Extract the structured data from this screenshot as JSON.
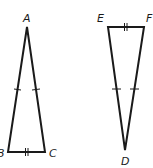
{
  "diagram": {
    "type": "congruent isosceles triangles",
    "triangles": [
      {
        "name": "ABC",
        "vertices": {
          "A": {
            "label": "A",
            "x": 27,
            "y": 27,
            "label_x": 24,
            "label_y": 22
          },
          "B": {
            "label": "B",
            "x": 8,
            "y": 152,
            "label_x": -3,
            "label_y": 157
          },
          "C": {
            "label": "C",
            "x": 45,
            "y": 152,
            "label_x": 49,
            "label_y": 157
          }
        },
        "congruence_marks": {
          "AB": "single tick",
          "AC": "single tick",
          "BC": "double tick"
        }
      },
      {
        "name": "DEF",
        "vertices": {
          "E": {
            "label": "E",
            "x": 108,
            "y": 27,
            "label_x": 97,
            "label_y": 22
          },
          "F": {
            "label": "F",
            "x": 144,
            "y": 27,
            "label_x": 146,
            "label_y": 22
          },
          "D": {
            "label": "D",
            "x": 125,
            "y": 150,
            "label_x": 121,
            "label_y": 165
          }
        },
        "congruence_marks": {
          "ED": "single tick",
          "FD": "single tick",
          "EF": "double tick"
        }
      }
    ],
    "colors": {
      "stroke": "#1a1a1a",
      "background": "#ffffff"
    }
  }
}
